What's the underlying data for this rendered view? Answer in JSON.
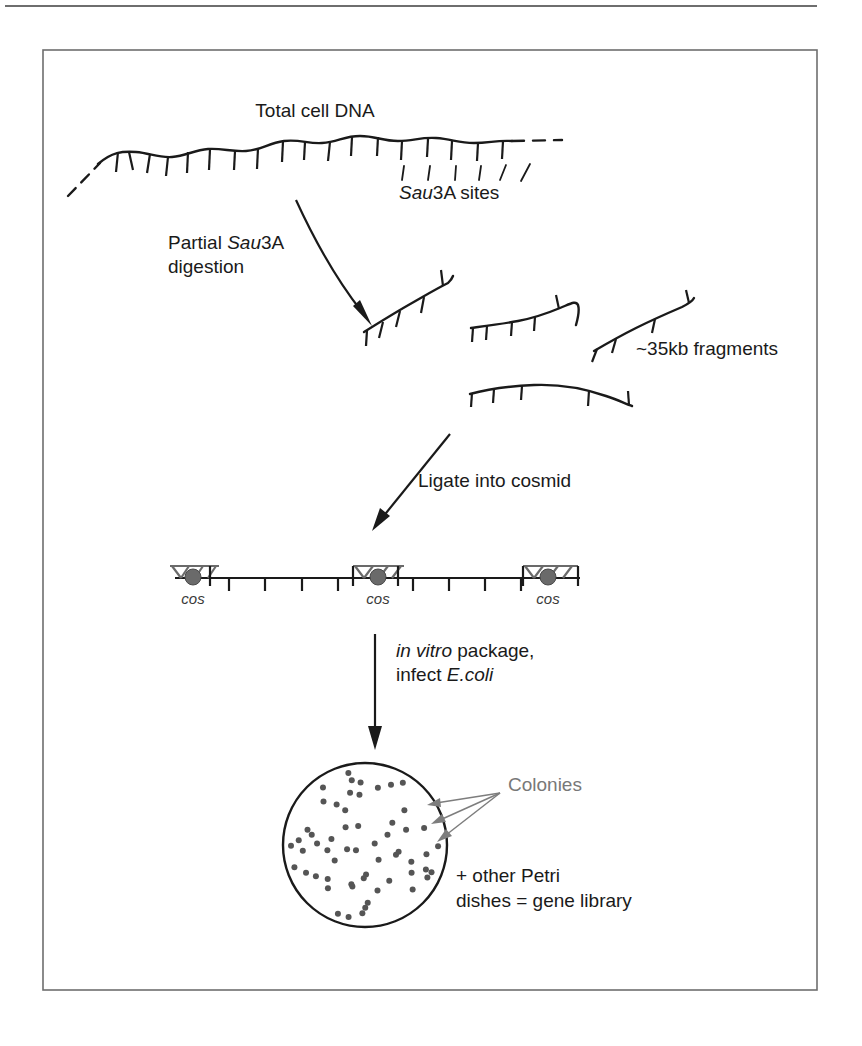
{
  "figure": {
    "domain": "diagram",
    "title_none": "",
    "background_color": "#ffffff",
    "frame": {
      "top_rule": {
        "x1": 5,
        "y1": 6,
        "x2": 817,
        "y2": 6,
        "color": "#6e6e6e"
      },
      "box": {
        "x": 43,
        "y": 50,
        "width": 774,
        "height": 940,
        "color": "#6e6e6e"
      }
    },
    "colors": {
      "ink": "#1a1a1a",
      "gray_label": "#787878",
      "cos_gray": "#6a6a6a",
      "colony_dot": "#555555",
      "frame": "#6e6e6e"
    }
  },
  "labels": {
    "total_cell_dna": "Total cell DNA",
    "sau3a_sites_italic": "Sau",
    "sau3a_sites_rest": "3A sites",
    "partial_line1_pre": "Partial ",
    "partial_line1_italic": "Sau",
    "partial_line1_post": "3A",
    "partial_line2": "digestion",
    "fragments": "~35kb fragments",
    "ligate": "Ligate into cosmid",
    "invitro_italic": "in vitro",
    "invitro_rest": " package,",
    "infect_pre": "infect ",
    "infect_italic": "E.coli",
    "colonies": "Colonies",
    "petri_line1": "+ other Petri",
    "petri_line2": "dishes = gene library",
    "cos": "cos"
  },
  "cos_map": {
    "line": {
      "x1": 175,
      "y1": 578,
      "x2": 580,
      "y2": 578
    },
    "cos_nodes": [
      {
        "cx": 193,
        "cy": 578,
        "label": "cos",
        "label_x": 193,
        "label_y": 602
      },
      {
        "cx": 378,
        "cy": 578,
        "label": "cos",
        "label_x": 378,
        "label_y": 602
      },
      {
        "cx": 548,
        "cy": 578,
        "label": "cos",
        "label_x": 548,
        "label_y": 602
      }
    ],
    "ticks_x": [
      229,
      265,
      302,
      338,
      413,
      449,
      485,
      521
    ],
    "tick_length": 13,
    "hatch_count_per_node": 4
  },
  "petri_dish": {
    "cx": 365,
    "cy": 845,
    "r": 82,
    "colony_count": 58,
    "dot_radius": 3.0,
    "colonies_label_x": 462,
    "colonies_label_y": 789,
    "arrow_tips": [
      {
        "x": 430,
        "y": 801
      },
      {
        "x": 434,
        "y": 817
      },
      {
        "x": 440,
        "y": 833
      }
    ],
    "arrow_origin": {
      "x": 500,
      "y": 793
    }
  },
  "dna_strand": {
    "note": "Total cell DNA wavy backbone with Sau3A restriction tick marks",
    "tick_count": 17,
    "dashed_ends": true
  },
  "fragments": {
    "count": 4,
    "size_label": "~35kb fragments"
  },
  "arrows": {
    "partial_digestion": {
      "type": "curved",
      "from": [
        298,
        205
      ],
      "to": [
        378,
        320
      ]
    },
    "ligate": {
      "type": "straight",
      "from": [
        448,
        437
      ],
      "to": [
        372,
        532
      ]
    },
    "package": {
      "type": "straight",
      "from": [
        375,
        634
      ],
      "to": [
        375,
        748
      ]
    }
  }
}
